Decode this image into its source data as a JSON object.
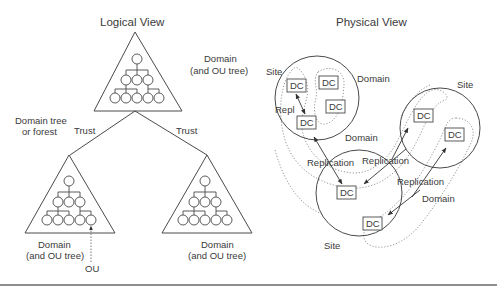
{
  "logical_view": {
    "title": "Logical View",
    "top_domain_label": [
      "Domain",
      "(and OU tree)"
    ],
    "forest_label": [
      "Domain tree",
      "or forest"
    ],
    "trust_left": "Trust",
    "trust_right": "Trust",
    "left_domain_label": [
      "Domain",
      "(and OU tree)"
    ],
    "right_domain_label": [
      "Domain",
      "(and OU tree)"
    ],
    "ou_label": "OU"
  },
  "physical_view": {
    "title": "Physical View",
    "site1_label": "Site",
    "site2_label": "Site",
    "site3_label": "Site",
    "domain_label_1": "Domain",
    "domain_label_2": "Domain",
    "domain_label_3": "Domain",
    "repl_label": "Repl",
    "replication_1": "Replication",
    "replication_2": "Replication",
    "replication_3": "Replication",
    "dc_label": "DC"
  },
  "colors": {
    "line": "#4a4a4a",
    "dotted": "#8a8a8a",
    "text": "#3a3a3a",
    "bottom_rule": "#6a6a6a"
  }
}
